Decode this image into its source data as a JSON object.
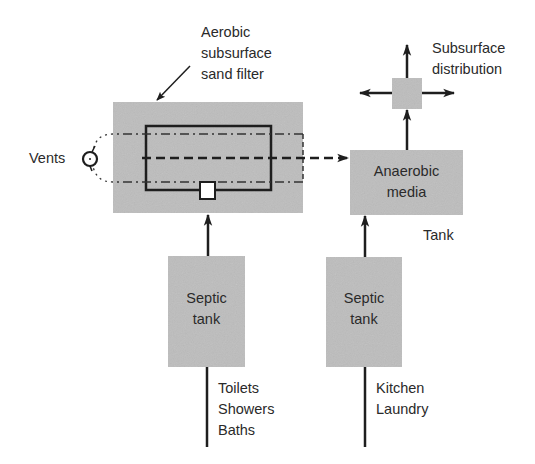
{
  "diagram": {
    "colors": {
      "box_fill": "#bdbdbd",
      "line": "#1e1e1e",
      "background": "#ffffff"
    },
    "nodes": {
      "sand_filter": {
        "callout": [
          "Aerobic",
          "subsurface",
          "sand filter"
        ]
      },
      "vents": {
        "label": "Vents"
      },
      "anaerobic_media": {
        "label": [
          "Anaerobic",
          "media"
        ],
        "caption": "Tank"
      },
      "distribution": {
        "label": [
          "Subsurface",
          "distribution"
        ]
      },
      "septic_tank_left": {
        "label": [
          "Septic",
          "tank"
        ],
        "sources": [
          "Toilets",
          "Showers",
          "Baths"
        ]
      },
      "septic_tank_right": {
        "label": [
          "Septic",
          "tank"
        ],
        "sources": [
          "Kitchen",
          "Laundry"
        ]
      }
    },
    "edges": [
      {
        "from": "septic_tank_left",
        "to": "sand_filter",
        "style": "solid"
      },
      {
        "from": "septic_tank_right",
        "to": "anaerobic_media",
        "style": "solid"
      },
      {
        "from": "sand_filter",
        "to": "anaerobic_media",
        "style": "dashed"
      },
      {
        "from": "anaerobic_media",
        "to": "distribution",
        "style": "solid"
      },
      {
        "from": "vents",
        "to": "sand_filter",
        "style": "dash-dot"
      }
    ]
  }
}
